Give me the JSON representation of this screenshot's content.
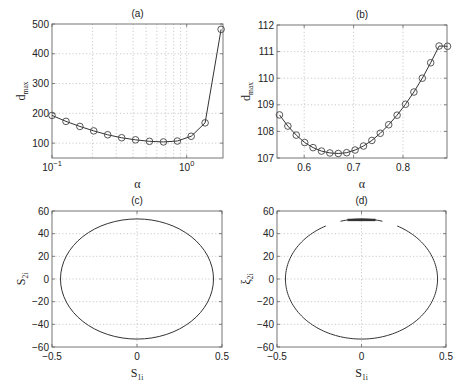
{
  "chart_data": [
    {
      "id": "a",
      "type": "line",
      "title": "(a)",
      "xlabel": "α",
      "ylabel": "d",
      "ylabel_sub": "max",
      "xscale": "log",
      "xlim": [
        0.1,
        1.86
      ],
      "ylim": [
        50,
        500
      ],
      "xticks": [
        0.1,
        1.0
      ],
      "xtick_labels": [
        "10",
        "10"
      ],
      "xtick_exps": [
        "−1",
        "0"
      ],
      "yticks": [
        100,
        200,
        300,
        400,
        500
      ],
      "ytick_labels": [
        "100",
        "200",
        "300",
        "400",
        "500"
      ],
      "grid": true,
      "marker": "circle",
      "x": [
        0.1,
        0.127,
        0.161,
        0.204,
        0.259,
        0.329,
        0.417,
        0.529,
        0.672,
        0.852,
        1.08,
        1.37,
        1.8
      ],
      "y": [
        193,
        173,
        156,
        141,
        128,
        118,
        111,
        106,
        104,
        107,
        123,
        168,
        482
      ]
    },
    {
      "id": "b",
      "type": "line",
      "title": "(b)",
      "xlabel": "α",
      "ylabel": "d",
      "ylabel_sub": "max",
      "xscale": "linear",
      "xlim": [
        0.545,
        0.889
      ],
      "ylim": [
        107,
        112
      ],
      "xticks": [
        0.6,
        0.7,
        0.8
      ],
      "xtick_labels": [
        "0.6",
        "0.7",
        "0.8"
      ],
      "yticks": [
        107,
        108,
        109,
        110,
        111,
        112
      ],
      "ytick_labels": [
        "107",
        "108",
        "109",
        "110",
        "111",
        "112"
      ],
      "grid": true,
      "marker": "circle",
      "x": [
        0.55,
        0.567,
        0.584,
        0.601,
        0.618,
        0.635,
        0.652,
        0.669,
        0.686,
        0.703,
        0.72,
        0.737,
        0.754,
        0.771,
        0.788,
        0.805,
        0.822,
        0.839,
        0.856,
        0.873,
        0.89
      ],
      "y": [
        108.62,
        108.2,
        107.86,
        107.58,
        107.39,
        107.26,
        107.19,
        107.17,
        107.2,
        107.3,
        107.45,
        107.66,
        107.93,
        108.25,
        108.61,
        109.02,
        109.48,
        110.0,
        110.58,
        111.21,
        111.2
      ]
    },
    {
      "id": "c",
      "type": "line",
      "title": "(c)",
      "xlabel": "S",
      "xlabel_sub": "1i",
      "ylabel": "S",
      "ylabel_sub": "2i",
      "xlim": [
        -0.5,
        0.5
      ],
      "ylim": [
        -60,
        60
      ],
      "xticks": [
        -0.5,
        0,
        0.5
      ],
      "xtick_labels": [
        "−0.5",
        "0",
        "0.5"
      ],
      "yticks": [
        -60,
        -40,
        -20,
        0,
        20,
        40,
        60
      ],
      "ytick_labels": [
        "−60",
        "−40",
        "−20",
        "0",
        "20",
        "40",
        "60"
      ],
      "grid": true,
      "shape": "ellipse",
      "center": [
        0,
        0
      ],
      "radius_x": 0.45,
      "radius_y": 53
    },
    {
      "id": "d",
      "type": "line",
      "title": "(d)",
      "xlabel": "S",
      "xlabel_sub": "1i",
      "ylabel": "ξ",
      "ylabel_sub": "2i",
      "xlim": [
        -0.5,
        0.5
      ],
      "ylim": [
        -60,
        60
      ],
      "xticks": [
        -0.5,
        0,
        0.5
      ],
      "xtick_labels": [
        "−0.5",
        "0",
        "0.5"
      ],
      "yticks": [
        -60,
        -40,
        -20,
        0,
        20,
        40,
        60
      ],
      "ytick_labels": [
        "−60",
        "−40",
        "−20",
        "0",
        "20",
        "40",
        "60"
      ],
      "grid": true,
      "shape": "ellipse",
      "center": [
        0,
        0
      ],
      "radius_x": 0.45,
      "radius_y": 53,
      "annotation": "gaps near top of ellipse (x≈-0.12 and x≈0.12), flattened segment at y≈53"
    }
  ],
  "layout": {
    "panels": [
      {
        "id": "a",
        "box": [
          52,
          24,
          223,
          158
        ]
      },
      {
        "id": "b",
        "box": [
          277,
          25,
          447,
          158
        ]
      },
      {
        "id": "c",
        "box": [
          52,
          211,
          222,
          347
        ]
      },
      {
        "id": "d",
        "box": [
          277,
          211,
          446,
          347
        ]
      }
    ]
  }
}
